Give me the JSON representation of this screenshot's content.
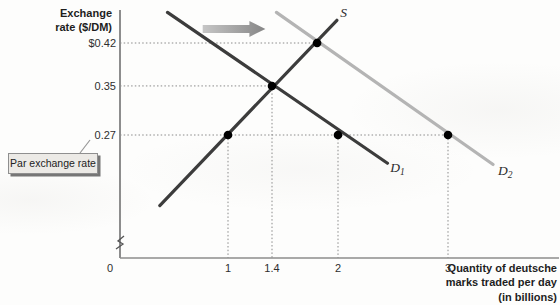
{
  "figure": {
    "y_axis_title_lines": [
      "Exchange",
      "rate ($/DM)"
    ],
    "x_axis_title_lines": [
      "Quantity of deutsche",
      "marks traded per day",
      "(in billions)"
    ],
    "callout": {
      "text": "Par exchange rate"
    }
  },
  "chart_data": {
    "type": "line",
    "title": "",
    "xlabel": "Quantity of deutsche marks traded per day (in billions)",
    "ylabel": "Exchange rate ($/DM)",
    "x_range": [
      0,
      4
    ],
    "y_axis_break": true,
    "grid": "dotted guide lines to labeled points only",
    "legend": "inline curve labels",
    "colors": {
      "curve_dark": "#3c3c3c",
      "curve_light": "#b4b4b4",
      "marker": "#000000",
      "arrow_from": "#c6c6c6",
      "arrow_to": "#868686",
      "guide": "#8a8a8a",
      "axis": "#8d8d8d"
    },
    "x_ticks": [
      {
        "label": "0",
        "value": 0,
        "dx": -8
      },
      {
        "label": "1",
        "value": 1
      },
      {
        "label": "1.4",
        "value": 1.4
      },
      {
        "label": "2",
        "value": 2
      },
      {
        "label": "3",
        "value": 3
      }
    ],
    "y_ticks": [
      {
        "label": "$0.42",
        "value": 0.42
      },
      {
        "label": "0.35",
        "value": 0.35
      },
      {
        "label": "0.27",
        "value": 0.27
      }
    ],
    "series": [
      {
        "name": "S",
        "role": "supply",
        "label": "S",
        "label_sub": "",
        "color": "#3c3c3c",
        "points": [
          [
            0.38,
            0.155
          ],
          [
            1.99,
            0.457
          ]
        ],
        "label_pos": [
          2.05,
          0.469
        ]
      },
      {
        "name": "D1",
        "role": "demand-initial",
        "label": "D",
        "label_sub": "1",
        "color": "#3c3c3c",
        "points": [
          [
            0.45,
            0.47
          ],
          [
            2.45,
            0.224
          ]
        ],
        "label_pos": [
          2.54,
          0.216
        ]
      },
      {
        "name": "D2",
        "role": "demand-shifted",
        "label": "D",
        "label_sub": "2",
        "color": "#b4b4b4",
        "points": [
          [
            1.44,
            0.47
          ],
          [
            3.41,
            0.222
          ]
        ],
        "label_pos": [
          3.52,
          0.212
        ]
      }
    ],
    "markers": [
      {
        "q": 1,
        "p": 0.27,
        "on": "S"
      },
      {
        "q": 1.4,
        "p": 0.35,
        "on": "S x D1 equilibrium"
      },
      {
        "q": 1.81,
        "p": 0.42,
        "on": "S x D2 equilibrium"
      },
      {
        "q": 2,
        "p": 0.27,
        "on": "D1"
      },
      {
        "q": 3,
        "p": 0.27,
        "on": "D2"
      }
    ],
    "guides": {
      "horizontal": [
        {
          "p": 0.42,
          "to_q": 1.81
        },
        {
          "p": 0.35,
          "to_q": 1.4
        },
        {
          "p": 0.27,
          "to_q": 3
        }
      ],
      "vertical": [
        {
          "q": 1,
          "from_p": 0.27
        },
        {
          "q": 1.4,
          "from_p": 0.35
        },
        {
          "q": 2,
          "from_p": 0.27
        },
        {
          "q": 3,
          "from_p": 0.27
        }
      ]
    },
    "annotations": [
      {
        "name": "demand-shift-right-arrow",
        "from_q": 0.77,
        "to_q": 1.34,
        "p": 0.443
      }
    ],
    "layout": {
      "x_origin_px": 118,
      "px_per_unit_x": 110,
      "y_ref_px": 135,
      "y_ref_value": 0.27,
      "px_per_value_y": 613.3,
      "plot": {
        "axis_x_px": 120,
        "axis_y_px": 258,
        "top_px": 10,
        "right_px": 559
      }
    }
  }
}
